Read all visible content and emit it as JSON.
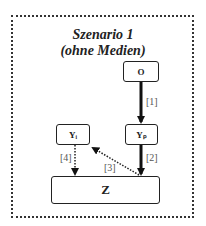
{
  "diagram": {
    "title_line1": "Szenario 1",
    "title_line2": "(ohne Medien)",
    "nodes": {
      "o": "O",
      "yp": "Yₚ",
      "yi": "Yᵢ",
      "z": "Z"
    },
    "edges": [
      {
        "id": "1",
        "label": "[1]",
        "from": "O",
        "to": "Yp",
        "style": "solid-thick"
      },
      {
        "id": "2",
        "label": "[2]",
        "from": "Yp",
        "to": "Z",
        "style": "solid-thick"
      },
      {
        "id": "3",
        "label": "[3]",
        "from": "Z",
        "to": "Yi",
        "style": "dotted"
      },
      {
        "id": "4",
        "label": "[4]",
        "from": "Yi",
        "to": "Z",
        "style": "dotted"
      }
    ]
  }
}
